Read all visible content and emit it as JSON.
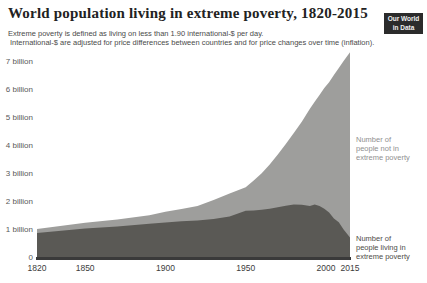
{
  "header": {
    "title": "World population living in extreme poverty, 1820-2015",
    "subtitle_line1": "Extreme poverty is defined as living on less than 1.90 international-$ per day.",
    "subtitle_line2": "International-$ are adjusted for price differences between countries and for price changes over time (inflation).",
    "logo": {
      "line1": "Our World",
      "line2": "in Data"
    }
  },
  "annotations": {
    "not_poverty": {
      "lines": [
        "Number of",
        "people not in",
        "extreme poverty"
      ]
    },
    "poverty": {
      "lines": [
        "Number of",
        "people living in",
        "extreme poverty"
      ]
    }
  },
  "colors": {
    "poverty_area": "#5a5955",
    "not_poverty_area": "#9e9e9c",
    "axis_line": "#3a3a3a",
    "logo_bg": "#2b2b2b",
    "title_text": "#222222",
    "subtitle_text": "#4a4a4a",
    "y_tick_text": "#595959",
    "x_tick_text": "#3c3c3c",
    "annotation_not_poverty_text": "#909090",
    "annotation_poverty_text": "#4e4c48"
  },
  "chart_data": {
    "type": "area",
    "stacked": true,
    "title": "World population living in extreme poverty, 1820-2015",
    "xlabel": "",
    "ylabel": "",
    "x": [
      1820,
      1850,
      1870,
      1890,
      1900,
      1910,
      1920,
      1930,
      1940,
      1950,
      1955,
      1960,
      1965,
      1970,
      1975,
      1980,
      1985,
      1990,
      1993,
      1996,
      1999,
      2002,
      2005,
      2008,
      2011,
      2015
    ],
    "series": [
      {
        "name": "Number of people living in extreme poverty",
        "color": "#5a5955",
        "values": [
          0.89,
          1.05,
          1.13,
          1.22,
          1.27,
          1.31,
          1.34,
          1.39,
          1.48,
          1.69,
          1.7,
          1.72,
          1.76,
          1.81,
          1.87,
          1.91,
          1.9,
          1.86,
          1.91,
          1.86,
          1.76,
          1.62,
          1.41,
          1.28,
          1.02,
          0.73
        ]
      },
      {
        "name": "Number of people not in extreme poverty",
        "color": "#9e9e9c",
        "values": [
          0.15,
          0.21,
          0.24,
          0.31,
          0.38,
          0.44,
          0.52,
          0.68,
          0.82,
          0.84,
          1.07,
          1.31,
          1.58,
          1.89,
          2.2,
          2.55,
          2.97,
          3.47,
          3.67,
          3.96,
          4.31,
          4.66,
          5.13,
          5.51,
          6.02,
          6.62
        ]
      }
    ],
    "units": "billions of people",
    "x_ticks": [
      1820,
      1850,
      1900,
      1950,
      2000,
      2015
    ],
    "y_ticks": [
      "0",
      "1 billion",
      "2 billion",
      "3 billion",
      "4 billion",
      "5 billion",
      "6 billion",
      "7 billion"
    ],
    "xlim": [
      1820,
      2015
    ],
    "ylim": [
      0,
      7.43
    ],
    "grid": false,
    "legend_position": "right-annotations"
  }
}
